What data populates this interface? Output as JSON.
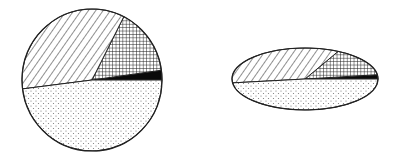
{
  "chart_data": [
    {
      "type": "pie",
      "title": "",
      "shape": "circle",
      "center": [
        92,
        80
      ],
      "radius": [
        70,
        71
      ],
      "start_angle_deg": 0,
      "direction": "counterclockwise",
      "slices": [
        {
          "name": "black",
          "pattern": "solid-black",
          "percent": 2.2
        },
        {
          "name": "crosshatch",
          "pattern": "crosshatch",
          "percent": 15.3
        },
        {
          "name": "diagonal",
          "pattern": "diagonal-hatch",
          "percent": 34.5
        },
        {
          "name": "dots",
          "pattern": "stipple",
          "percent": 48.0
        }
      ],
      "legend": "none",
      "labels": "none"
    },
    {
      "type": "pie",
      "title": "",
      "shape": "ellipse",
      "center": [
        305,
        79
      ],
      "radius": [
        73,
        31
      ],
      "start_angle_deg": 0,
      "direction": "counterclockwise",
      "slices": [
        {
          "name": "black",
          "pattern": "solid-black",
          "percent": 2.2
        },
        {
          "name": "crosshatch",
          "pattern": "crosshatch",
          "percent": 15.3
        },
        {
          "name": "diagonal",
          "pattern": "diagonal-hatch",
          "percent": 34.5
        },
        {
          "name": "dots",
          "pattern": "stipple",
          "percent": 48.0
        }
      ],
      "legend": "none",
      "labels": "none"
    }
  ],
  "colors": {
    "stroke": "#222222",
    "fill_black": "#0a0a0a",
    "pattern_ink": "#333333",
    "dot_ink": "#777777",
    "background": "#ffffff"
  }
}
